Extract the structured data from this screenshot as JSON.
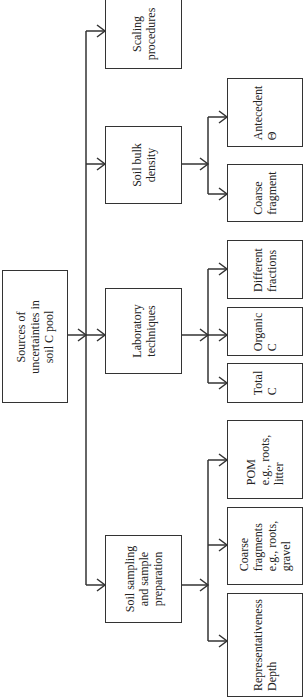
{
  "diagram": {
    "orientation": "rotated-90-ccw",
    "root": {
      "label": "Sources of\nuncertainties in\nsoil C pool"
    },
    "categories": [
      {
        "label": "Scaling\nprocedures",
        "children": []
      },
      {
        "label": "Soil bulk\ndensity",
        "children": [
          {
            "label": "Antecedent\nΘ"
          },
          {
            "label": "Coarse\nfragment"
          }
        ]
      },
      {
        "label": "Laboratory\ntechniques",
        "children": [
          {
            "label": "Different\nfractions"
          },
          {
            "label": "Organic\nC"
          },
          {
            "label": "Total\nC"
          }
        ]
      },
      {
        "label": "Soil sampling\nand sample\npreparation",
        "children": [
          {
            "label": "POM\ne.g., roots,\nlitter"
          },
          {
            "label": "Coarse\nfragments\ne.g., roots,\ngravel"
          },
          {
            "label": "Representativeness\nDepth"
          }
        ]
      }
    ]
  }
}
